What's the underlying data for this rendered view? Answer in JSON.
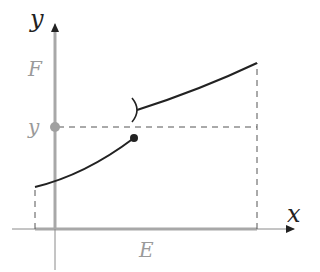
{
  "diagram": {
    "title": "",
    "axes": {
      "x_label": "x",
      "y_label": "y",
      "origin": [
        55,
        229
      ],
      "x_axis": {
        "from": 12,
        "to": 296
      },
      "y_axis": {
        "from": 270,
        "to": 22
      }
    },
    "labels": {
      "domain": "E",
      "codomain": "F",
      "value": "y"
    },
    "colors": {
      "axis": "#9a9a9a",
      "axis_dark": "#333333",
      "highlight": "#a8a8a8",
      "curve": "#222222",
      "dashed": "#555555",
      "label_gray": "#9a9a9a",
      "label_dark": "#222222"
    },
    "function": {
      "segments": [
        {
          "name": "lower-branch",
          "start": [
            35,
            187
          ],
          "end": [
            134,
            138
          ],
          "end_marker": "closed-dot"
        },
        {
          "name": "upper-branch",
          "start": [
            137,
            110
          ],
          "end": [
            257,
            63
          ],
          "start_marker": "open-bracket"
        }
      ],
      "jump_x": 134
    },
    "guides": {
      "horizontal_dashed_y": 127,
      "left_dashed_x": 35,
      "right_dashed_x": 257
    },
    "domain_interval": {
      "x_from": 35,
      "x_to": 257
    },
    "codomain_interval": {
      "y_from": 229,
      "y_to": 30
    },
    "highlight_point": {
      "x": 55,
      "y": 127
    }
  }
}
